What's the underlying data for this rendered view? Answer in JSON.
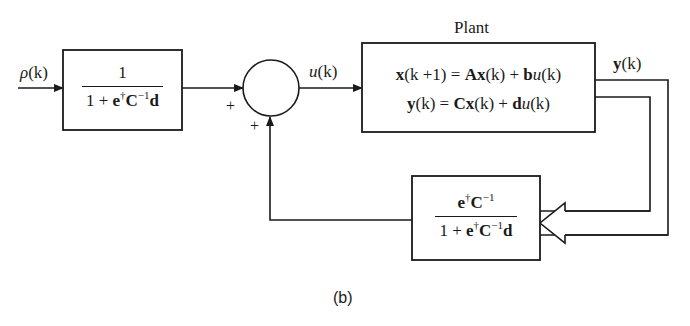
{
  "diagram": {
    "caption": "(b)",
    "input_signal": {
      "symbol": "ρ",
      "arg": "(k)"
    },
    "prefilter_block": {
      "numerator": "1",
      "denominator": {
        "one": "1",
        "plus": "+",
        "e": "e",
        "dagger": "†",
        "C": "C",
        "inv": "−1",
        "d": "d"
      }
    },
    "summing_junction": {
      "left_sign": "+",
      "bottom_sign": "+"
    },
    "control_signal": {
      "symbol": "u",
      "arg": "(k)"
    },
    "plant_block": {
      "title": "Plant",
      "state_equation": {
        "x": "x",
        "lhs_arg": "(k +1)",
        "eq": "=",
        "A": "A",
        "x2": "x",
        "arg2": "(k)",
        "plus": "+",
        "b": "b",
        "u": "u",
        "arg3": "(k)"
      },
      "output_equation": {
        "y": "y",
        "lhs_arg": "(k)",
        "eq": "=",
        "C": "C",
        "x": "x",
        "arg2": "(k)",
        "plus": "+",
        "d": "d",
        "u": "u",
        "arg3": "(k)"
      }
    },
    "output_signal": {
      "symbol": "y",
      "arg": "(k)"
    },
    "feedback_block": {
      "numerator": {
        "e": "e",
        "dagger": "†",
        "C": "C",
        "inv": "−1"
      },
      "denominator": {
        "one": "1",
        "plus": "+",
        "e": "e",
        "dagger": "†",
        "C": "C",
        "inv": "−1",
        "d": "d"
      }
    },
    "colors": {
      "ink": "#1a1a1a",
      "background": "#ffffff"
    }
  }
}
